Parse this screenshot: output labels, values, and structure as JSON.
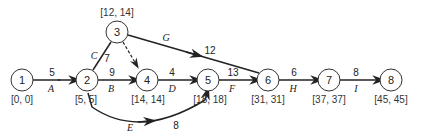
{
  "diagram": {
    "type": "activity-on-arrow network",
    "nodes": [
      {
        "id": "1",
        "label": "1",
        "times": "[0, 0]"
      },
      {
        "id": "2",
        "label": "2",
        "times": "[5, 5]"
      },
      {
        "id": "3",
        "label": "3",
        "times": "[12, 14]"
      },
      {
        "id": "4",
        "label": "4",
        "times": "[14, 14]"
      },
      {
        "id": "5",
        "label": "5",
        "times": "[18, 18]"
      },
      {
        "id": "6",
        "label": "6",
        "times": "[31, 31]"
      },
      {
        "id": "7",
        "label": "7",
        "times": "[37, 37]"
      },
      {
        "id": "8",
        "label": "8",
        "times": "[45, 45]"
      }
    ],
    "edges": [
      {
        "from": "1",
        "to": "2",
        "activity": "A",
        "duration": "5"
      },
      {
        "from": "2",
        "to": "4",
        "activity": "B",
        "duration": "9"
      },
      {
        "from": "2",
        "to": "3",
        "activity": "C",
        "duration": "7"
      },
      {
        "from": "4",
        "to": "5",
        "activity": "D",
        "duration": "4"
      },
      {
        "from": "2",
        "to": "5",
        "activity": "E",
        "duration": "8"
      },
      {
        "from": "5",
        "to": "6",
        "activity": "F",
        "duration": "13"
      },
      {
        "from": "3",
        "to": "6",
        "activity": "G",
        "duration": "12"
      },
      {
        "from": "6",
        "to": "7",
        "activity": "H",
        "duration": "6"
      },
      {
        "from": "7",
        "to": "8",
        "activity": "I",
        "duration": "8"
      },
      {
        "from": "3",
        "to": "4",
        "activity": "dummy",
        "duration": ""
      }
    ]
  }
}
